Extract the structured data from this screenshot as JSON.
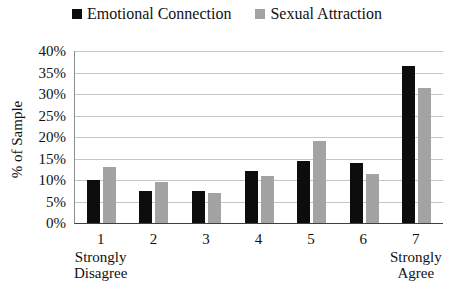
{
  "colors": {
    "series1": "#0d0d0d",
    "series2": "#a3a3a3",
    "gridline": "#c6c6c6",
    "axis": "#3f3f3f",
    "background": "#ffffff"
  },
  "chart_data": {
    "type": "bar",
    "title": "",
    "xlabel": "",
    "ylabel": "% of Sample",
    "ylim": [
      0,
      40
    ],
    "ytick_step": 5,
    "ytick_labels": [
      "0%",
      "5%",
      "10%",
      "15%",
      "20%",
      "25%",
      "30%",
      "35%",
      "40%"
    ],
    "grid": true,
    "legend_position": "top",
    "categories": [
      "1",
      "2",
      "3",
      "4",
      "5",
      "6",
      "7"
    ],
    "axis_annotations": [
      {
        "category": "1",
        "lines": [
          "Strongly",
          "Disagree"
        ]
      },
      {
        "category": "7",
        "lines": [
          "Strongly",
          "Agree"
        ]
      }
    ],
    "series": [
      {
        "name": "Emotional Connection",
        "color": "#0d0d0d",
        "values": [
          10,
          7.5,
          7.5,
          12,
          14.5,
          14,
          36.5
        ]
      },
      {
        "name": "Sexual Attraction",
        "color": "#a3a3a3",
        "values": [
          13,
          9.5,
          7,
          11,
          19,
          11.5,
          31.5
        ]
      }
    ]
  }
}
